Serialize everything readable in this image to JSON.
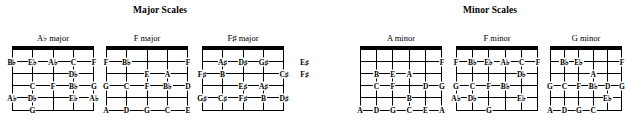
{
  "sections": [
    {
      "id": "major",
      "title": "Major Scales"
    },
    {
      "id": "minor",
      "title": "Minor Scales"
    }
  ],
  "diagrams": [
    {
      "name": "A♭ major",
      "section": "major",
      "strings": 5,
      "frets": 5,
      "left": 12,
      "width": 82,
      "notes": [
        {
          "fret": 1,
          "string": 1,
          "label": "B♭"
        },
        {
          "fret": 1,
          "string": 2,
          "label": "E♭"
        },
        {
          "fret": 1,
          "string": 3,
          "label": "A♭"
        },
        {
          "fret": 1,
          "string": 4,
          "label": "C"
        },
        {
          "fret": 1,
          "string": 5,
          "label": "F"
        },
        {
          "fret": 2,
          "string": 4,
          "label": "D♭"
        },
        {
          "fret": 3,
          "string": 2,
          "label": "C"
        },
        {
          "fret": 3,
          "string": 3,
          "label": "F"
        },
        {
          "fret": 3,
          "string": 4,
          "label": "B♭"
        },
        {
          "fret": 3,
          "string": 5,
          "label": "G"
        },
        {
          "fret": 4,
          "string": 1,
          "label": "A♭"
        },
        {
          "fret": 4,
          "string": 2,
          "label": "D♭"
        },
        {
          "fret": 4,
          "string": 4,
          "label": "E♭"
        },
        {
          "fret": 4,
          "string": 5,
          "label": "A♭"
        },
        {
          "fret": 5,
          "string": 2,
          "label": "G"
        }
      ]
    },
    {
      "name": "F major",
      "section": "major",
      "strings": 5,
      "frets": 5,
      "left": 106,
      "width": 82,
      "notes": [
        {
          "fret": 1,
          "string": 1,
          "label": "F"
        },
        {
          "fret": 1,
          "string": 2,
          "label": "B♭"
        },
        {
          "fret": 1,
          "string": 5,
          "label": "F"
        },
        {
          "fret": 2,
          "string": 3,
          "label": "E"
        },
        {
          "fret": 2,
          "string": 4,
          "label": "A"
        },
        {
          "fret": 3,
          "string": 1,
          "label": "G"
        },
        {
          "fret": 3,
          "string": 2,
          "label": "C"
        },
        {
          "fret": 3,
          "string": 3,
          "label": "F"
        },
        {
          "fret": 3,
          "string": 4,
          "label": "B♭"
        },
        {
          "fret": 3,
          "string": 5,
          "label": "D"
        },
        {
          "fret": 5,
          "string": 1,
          "label": "A"
        },
        {
          "fret": 5,
          "string": 2,
          "label": "D"
        },
        {
          "fret": 5,
          "string": 3,
          "label": "G"
        },
        {
          "fret": 5,
          "string": 4,
          "label": "C"
        },
        {
          "fret": 5,
          "string": 5,
          "label": "E"
        }
      ]
    },
    {
      "name": "F♯ major",
      "section": "major",
      "strings": 5,
      "frets": 5,
      "left": 202,
      "width": 82,
      "notes": [
        {
          "fret": 1,
          "string": 2,
          "label": "A♯"
        },
        {
          "fret": 1,
          "string": 3,
          "label": "D♯"
        },
        {
          "fret": 1,
          "string": 4,
          "label": "G♯"
        },
        {
          "fret": 1,
          "string": 6,
          "label": "E♯"
        },
        {
          "fret": 2,
          "string": 1,
          "label": "F♯"
        },
        {
          "fret": 2,
          "string": 2,
          "label": "B"
        },
        {
          "fret": 2,
          "string": 5,
          "label": "C♯"
        },
        {
          "fret": 2,
          "string": 6,
          "label": "F♯"
        },
        {
          "fret": 3,
          "string": 3,
          "label": "E♯"
        },
        {
          "fret": 3,
          "string": 4,
          "label": "A♯"
        },
        {
          "fret": 4,
          "string": 1,
          "label": "G♯"
        },
        {
          "fret": 4,
          "string": 2,
          "label": "C♯"
        },
        {
          "fret": 4,
          "string": 3,
          "label": "F♯"
        },
        {
          "fret": 4,
          "string": 4,
          "label": "B"
        },
        {
          "fret": 4,
          "string": 5,
          "label": "D♯"
        }
      ]
    },
    {
      "name": "A minor",
      "section": "minor",
      "strings": 6,
      "frets": 5,
      "left": 360,
      "width": 82,
      "notes": [
        {
          "fret": 1,
          "string": 6,
          "label": "F"
        },
        {
          "fret": 2,
          "string": 2,
          "label": "B"
        },
        {
          "fret": 2,
          "string": 3,
          "label": "E"
        },
        {
          "fret": 2,
          "string": 4,
          "label": "A"
        },
        {
          "fret": 3,
          "string": 2,
          "label": "C"
        },
        {
          "fret": 3,
          "string": 3,
          "label": "F"
        },
        {
          "fret": 3,
          "string": 5,
          "label": "D"
        },
        {
          "fret": 3,
          "string": 6,
          "label": "G"
        },
        {
          "fret": 4,
          "string": 4,
          "label": "B"
        },
        {
          "fret": 5,
          "string": 1,
          "label": "A"
        },
        {
          "fret": 5,
          "string": 2,
          "label": "D"
        },
        {
          "fret": 5,
          "string": 3,
          "label": "G"
        },
        {
          "fret": 5,
          "string": 4,
          "label": "C"
        },
        {
          "fret": 5,
          "string": 5,
          "label": "E"
        },
        {
          "fret": 5,
          "string": 6,
          "label": "A"
        }
      ]
    },
    {
      "name": "F minor",
      "section": "minor",
      "strings": 6,
      "frets": 5,
      "left": 456,
      "width": 82,
      "notes": [
        {
          "fret": 1,
          "string": 1,
          "label": "F"
        },
        {
          "fret": 1,
          "string": 2,
          "label": "B♭"
        },
        {
          "fret": 1,
          "string": 3,
          "label": "E♭"
        },
        {
          "fret": 1,
          "string": 4,
          "label": "A♭"
        },
        {
          "fret": 1,
          "string": 5,
          "label": "C"
        },
        {
          "fret": 1,
          "string": 6,
          "label": "F"
        },
        {
          "fret": 2,
          "string": 5,
          "label": "D♭"
        },
        {
          "fret": 3,
          "string": 1,
          "label": "G"
        },
        {
          "fret": 3,
          "string": 2,
          "label": "C"
        },
        {
          "fret": 3,
          "string": 3,
          "label": "F"
        },
        {
          "fret": 3,
          "string": 4,
          "label": "B♭"
        },
        {
          "fret": 4,
          "string": 1,
          "label": "A♭"
        },
        {
          "fret": 4,
          "string": 2,
          "label": "D♭"
        },
        {
          "fret": 4,
          "string": 5,
          "label": "E♭"
        },
        {
          "fret": 5,
          "string": 3,
          "label": "G"
        }
      ]
    },
    {
      "name": "G minor",
      "section": "minor",
      "strings": 6,
      "frets": 5,
      "left": 550,
      "width": 72,
      "notes": [
        {
          "fret": 1,
          "string": 2,
          "label": "B♭"
        },
        {
          "fret": 1,
          "string": 3,
          "label": "E♭"
        },
        {
          "fret": 1,
          "string": 6,
          "label": "F"
        },
        {
          "fret": 2,
          "string": 4,
          "label": "A"
        },
        {
          "fret": 3,
          "string": 1,
          "label": "G"
        },
        {
          "fret": 3,
          "string": 2,
          "label": "C"
        },
        {
          "fret": 3,
          "string": 3,
          "label": "F"
        },
        {
          "fret": 3,
          "string": 4,
          "label": "B♭"
        },
        {
          "fret": 3,
          "string": 5,
          "label": "D"
        },
        {
          "fret": 3,
          "string": 6,
          "label": "G"
        },
        {
          "fret": 4,
          "string": 5,
          "label": "E♭"
        },
        {
          "fret": 5,
          "string": 1,
          "label": "A"
        },
        {
          "fret": 5,
          "string": 2,
          "label": "D"
        },
        {
          "fret": 5,
          "string": 3,
          "label": "G"
        },
        {
          "fret": 5,
          "string": 4,
          "label": "C"
        }
      ]
    }
  ]
}
